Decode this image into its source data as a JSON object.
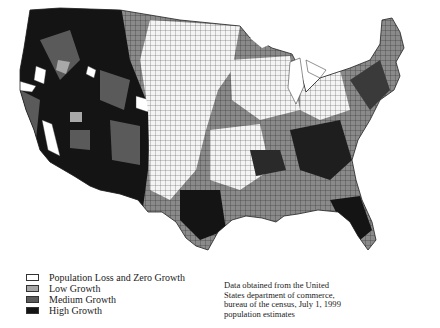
{
  "map": {
    "subject": "United States county population growth",
    "region": "Contiguous United States by county",
    "colors": {
      "loss_zero": "#ffffff",
      "low": "#a8a8a8",
      "medium": "#5a5a5a",
      "high": "#141414",
      "border": "#3a3a3a"
    }
  },
  "legend": {
    "items": [
      {
        "label": "Population Loss and Zero Growth",
        "color": "#ffffff"
      },
      {
        "label": "Low Growth",
        "color": "#a8a8a8"
      },
      {
        "label": "Medium Growth",
        "color": "#5a5a5a"
      },
      {
        "label": "High Growth",
        "color": "#141414"
      }
    ]
  },
  "source_note": "Data obtained from the United States department of commerce, bureau of the census, July 1, 1999 population estimates"
}
